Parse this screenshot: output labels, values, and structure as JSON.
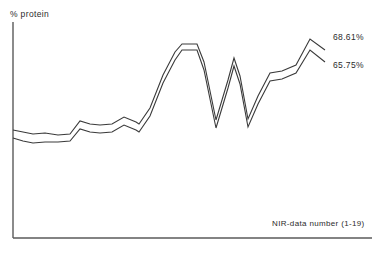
{
  "chart_data": {
    "type": "line",
    "title": "",
    "subtitle": "",
    "xlabel": "NIR-data number (1-19)",
    "ylabel": "% protein",
    "grid": false,
    "legend_position": "inline-right-end-labels",
    "axes": {
      "x_axis_visible": true,
      "y_axis_visible": true,
      "x_ticks_visible": false,
      "y_ticks_visible": false,
      "x_tick_labels": [],
      "y_tick_labels": []
    },
    "x": [
      1,
      2,
      3,
      4,
      5,
      6,
      7,
      8,
      9,
      10,
      11,
      12,
      13,
      14,
      15,
      16,
      17,
      18,
      19
    ],
    "xlim": [
      1,
      19
    ],
    "ylim": [
      60,
      72
    ],
    "series": [
      {
        "name": "Upper curve",
        "end_label": "68.61%",
        "values": [
          64.8,
          64.65,
          64.55,
          64.95,
          65.85,
          65.65,
          65.55,
          66.15,
          65.7,
          69.75,
          69.75,
          63.6,
          68.45,
          64.35,
          67.7,
          67.85,
          69.1,
          70.25,
          68.61
        ]
      },
      {
        "name": "Lower curve",
        "end_label": "65.75%",
        "values": [
          64.35,
          64.15,
          64.05,
          64.5,
          65.4,
          65.2,
          65.1,
          65.7,
          65.25,
          69.2,
          69.2,
          63.05,
          67.9,
          63.8,
          67.15,
          67.3,
          68.55,
          69.55,
          65.75
        ]
      }
    ],
    "annotations": [
      {
        "name": "upper-end-label",
        "text": "68.61%"
      },
      {
        "name": "lower-end-label",
        "text": "65.75%"
      }
    ],
    "colors": {
      "line": "#3a3a3a",
      "axis": "#5a5a5a",
      "background": "#ffffff",
      "text": "#2b2b2b"
    },
    "geometry": {
      "upper_path": "M13,130 L23,132 L33,134 L45,133 L58,135 L70,134 L80,121 L90,124 L100,125 L112,124 L124,117 L136,122 L139,124 L150,108 L163,75 L175,52 L182,44 L197,44 L204,62 L216,120 L228,80 L234,58 L240,76 L248,119 L258,96 L270,73 L282,71 L296,65 L310,39 L325,50",
      "lower_path": "M13,138 L23,141 L33,143 L45,142 L58,142 L70,141 L80,129 L90,132 L100,133 L112,132 L124,125 L136,130 L139,132 L150,116 L163,83 L175,60 L182,50 L197,50 L204,70 L216,128 L228,88 L234,66 L240,84 L248,127 L258,104 L270,81 L282,79 L296,73 L310,50 L325,62",
      "y_axis": "M13,22 L13,238",
      "x_axis": "M13,238 L372,238"
    }
  }
}
